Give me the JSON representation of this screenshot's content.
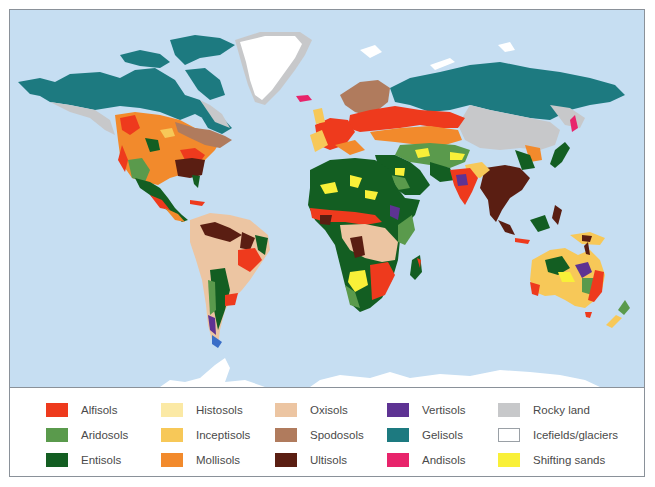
{
  "map": {
    "ocean_color": "#c6def2",
    "regions": [
      "North America",
      "Greenland",
      "South America",
      "Europe",
      "Africa",
      "Asia",
      "Australia",
      "New Zealand",
      "Antarctica"
    ]
  },
  "legend": {
    "columns": [
      {
        "items": [
          {
            "label": "Alfisols",
            "color": "#ee3a1d"
          },
          {
            "label": "Aridosols",
            "color": "#5a9a4c"
          },
          {
            "label": "Entisols",
            "color": "#135e22"
          }
        ]
      },
      {
        "items": [
          {
            "label": "Histosols",
            "color": "#fbe9a5"
          },
          {
            "label": "Inceptisols",
            "color": "#f7c858"
          },
          {
            "label": "Mollisols",
            "color": "#f28a2c"
          }
        ]
      },
      {
        "items": [
          {
            "label": "Oxisols",
            "color": "#ecc5a2"
          },
          {
            "label": "Spodosols",
            "color": "#b07b5d"
          },
          {
            "label": "Ultisols",
            "color": "#5a1e12"
          }
        ]
      },
      {
        "items": [
          {
            "label": "Vertisols",
            "color": "#5e3393"
          },
          {
            "label": "Gelisols",
            "color": "#1d7a80"
          },
          {
            "label": "Andisols",
            "color": "#e8246b"
          }
        ]
      },
      {
        "items": [
          {
            "label": "Rocky land",
            "color": "#c7c8ca"
          },
          {
            "label": "Icefields/glaciers",
            "color": "#ffffff"
          },
          {
            "label": "Shifting sands",
            "color": "#f9f038"
          }
        ]
      }
    ]
  }
}
